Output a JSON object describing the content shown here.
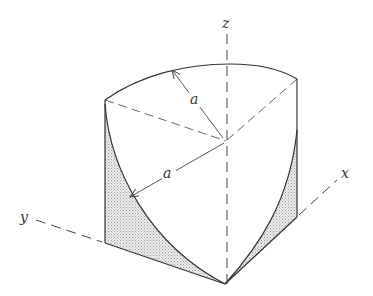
{
  "figure": {
    "axes": {
      "x_label": "x",
      "y_label": "y",
      "z_label": "z"
    },
    "dimensions": {
      "upper_radius_label": "a",
      "lower_radius_label": "a"
    },
    "colors": {
      "stroke": "#333333",
      "shading": "#d9d9d9",
      "background": "#ffffff"
    }
  }
}
